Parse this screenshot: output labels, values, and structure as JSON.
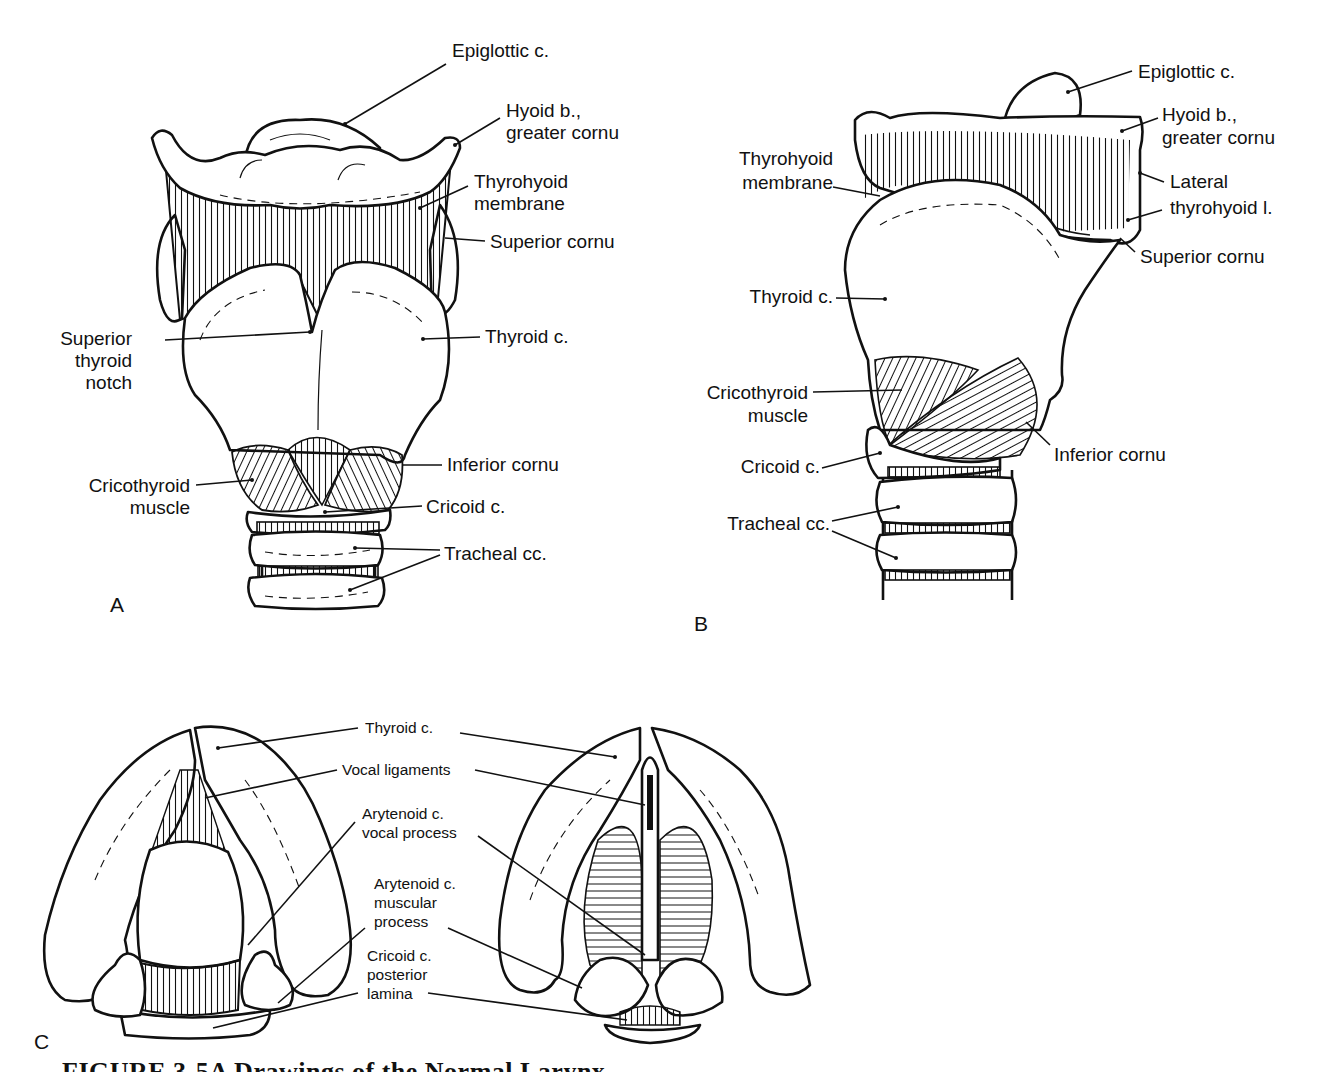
{
  "figure": {
    "caption": "FIGURE 3-5A   Drawings of the Normal Larynx",
    "panels": [
      {
        "id": "A",
        "view": "anterior",
        "labels": {
          "epiglottic": "Epiglottic c.",
          "hyoid_1": "Hyoid b.,",
          "hyoid_2": "greater cornu",
          "thyrohyoid_1": "Thyrohyoid",
          "thyrohyoid_2": "membrane",
          "superior_cornu": "Superior cornu",
          "notch_1": "Superior",
          "notch_2": "thyroid",
          "notch_3": "notch",
          "thyroid": "Thyroid c.",
          "inferior_cornu": "Inferior cornu",
          "cricothyroid_1": "Cricothyroid",
          "cricothyroid_2": "muscle",
          "cricoid": "Cricoid c.",
          "tracheal": "Tracheal cc."
        }
      },
      {
        "id": "B",
        "view": "lateral",
        "labels": {
          "epiglottic": "Epiglottic c.",
          "hyoid_1": "Hyoid b.,",
          "hyoid_2": "greater cornu",
          "thyrohyoid_1": "Thyrohyoid",
          "thyrohyoid_2": "membrane",
          "lateral_1": "Lateral",
          "lateral_2": "thyrohyoid l.",
          "superior_cornu": "Superior cornu",
          "thyroid": "Thyroid c.",
          "cricothyroid_1": "Cricothyroid",
          "cricothyroid_2": "muscle",
          "inferior_cornu": "Inferior cornu",
          "cricoid": "Cricoid c.",
          "tracheal": "Tracheal cc."
        }
      },
      {
        "id": "C",
        "view": "superior (abducted and adducted)",
        "labels": {
          "thyroid": "Thyroid c.",
          "vocal_ligaments": "Vocal ligaments",
          "arytenoid_vocal_1": "Arytenoid c.",
          "arytenoid_vocal_2": "vocal process",
          "arytenoid_musc_1": "Arytenoid c.",
          "arytenoid_musc_2": "muscular",
          "arytenoid_musc_3": "process",
          "cricoid_1": "Cricoid c.",
          "cricoid_2": "posterior",
          "cricoid_3": "lamina"
        }
      }
    ]
  }
}
